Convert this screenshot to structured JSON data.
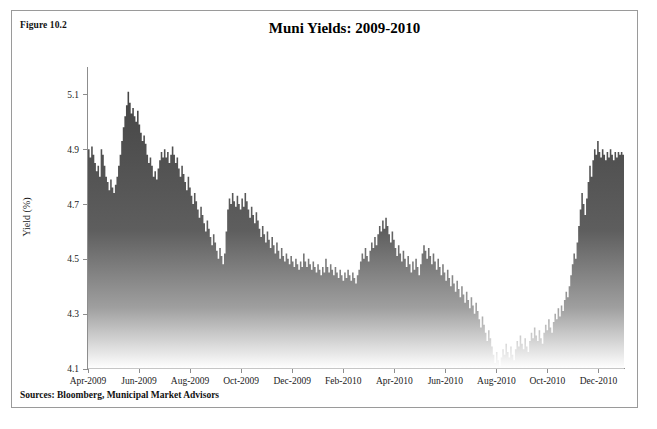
{
  "figure": {
    "label": "Figure 10.2",
    "title": "Muni Yields: 2009-2010",
    "sources": "Sources: Bloomberg, Municipal Market Advisors"
  },
  "colors": {
    "frame_border": "#9a9a9a",
    "area_top": "#4a4a4a",
    "area_bottom": "#ffffff",
    "axis": "#8d8d8d",
    "text": "#111111",
    "background": "#ffffff"
  },
  "chart_data": {
    "type": "area",
    "title": "Muni Yields: 2009-2010",
    "xlabel": "",
    "ylabel": "Yield (%)",
    "ylim": [
      4.1,
      5.2
    ],
    "yticks": [
      4.1,
      4.3,
      4.5,
      4.7,
      4.9,
      5.1
    ],
    "ytick_labels": [
      "4.1",
      "4.3",
      "4.5",
      "4.7",
      "4.9",
      "5.1"
    ],
    "grid": false,
    "legend": "none",
    "xtick_labels": [
      "Apr-2009",
      "Jun-2009",
      "Aug-2009",
      "Oct-2009",
      "Dec-2009",
      "Feb-2010",
      "Apr-2010",
      "Jun-2010",
      "Aug-2010",
      "Oct-2010",
      "Dec-2010"
    ],
    "xtick_positions": [
      0,
      0.0952,
      0.1905,
      0.2857,
      0.381,
      0.4762,
      0.5714,
      0.6667,
      0.7619,
      0.8571,
      0.9524
    ],
    "series": [
      {
        "name": "Muni Yield",
        "fill": "gradient-gray",
        "values": [
          4.93,
          4.9,
          4.87,
          4.91,
          4.88,
          4.85,
          4.82,
          4.84,
          4.8,
          4.9,
          4.88,
          4.84,
          4.8,
          4.78,
          4.75,
          4.79,
          4.76,
          4.74,
          4.77,
          4.8,
          4.84,
          4.88,
          4.93,
          4.98,
          5.02,
          5.06,
          5.11,
          5.07,
          5.03,
          5.05,
          5.02,
          5.0,
          5.04,
          4.99,
          4.96,
          4.93,
          4.95,
          4.92,
          4.88,
          4.85,
          4.87,
          4.84,
          4.8,
          4.82,
          4.79,
          4.83,
          4.86,
          4.89,
          4.87,
          4.9,
          4.87,
          4.89,
          4.85,
          4.88,
          4.91,
          4.88,
          4.85,
          4.87,
          4.83,
          4.8,
          4.84,
          4.81,
          4.78,
          4.75,
          4.8,
          4.76,
          4.73,
          4.7,
          4.74,
          4.71,
          4.68,
          4.65,
          4.69,
          4.66,
          4.63,
          4.6,
          4.64,
          4.61,
          4.58,
          4.55,
          4.59,
          4.56,
          4.53,
          4.5,
          4.54,
          4.51,
          4.48,
          4.52,
          4.6,
          4.68,
          4.72,
          4.7,
          4.74,
          4.71,
          4.69,
          4.73,
          4.7,
          4.68,
          4.72,
          4.69,
          4.74,
          4.71,
          4.68,
          4.65,
          4.69,
          4.66,
          4.63,
          4.67,
          4.64,
          4.61,
          4.58,
          4.62,
          4.59,
          4.56,
          4.6,
          4.57,
          4.54,
          4.58,
          4.55,
          4.52,
          4.56,
          4.53,
          4.5,
          4.54,
          4.51,
          4.49,
          4.52,
          4.5,
          4.48,
          4.51,
          4.49,
          4.47,
          4.5,
          4.48,
          4.46,
          4.49,
          4.47,
          4.52,
          4.49,
          4.47,
          4.5,
          4.48,
          4.46,
          4.49,
          4.47,
          4.45,
          4.48,
          4.46,
          4.44,
          4.47,
          4.45,
          4.5,
          4.47,
          4.45,
          4.48,
          4.46,
          4.44,
          4.47,
          4.45,
          4.43,
          4.46,
          4.44,
          4.42,
          4.45,
          4.43,
          4.46,
          4.44,
          4.42,
          4.45,
          4.43,
          4.41,
          4.44,
          4.46,
          4.49,
          4.52,
          4.5,
          4.54,
          4.51,
          4.49,
          4.53,
          4.56,
          4.54,
          4.58,
          4.55,
          4.59,
          4.62,
          4.6,
          4.64,
          4.61,
          4.65,
          4.62,
          4.59,
          4.56,
          4.6,
          4.57,
          4.54,
          4.51,
          4.55,
          4.52,
          4.49,
          4.53,
          4.5,
          4.47,
          4.51,
          4.48,
          4.45,
          4.49,
          4.46,
          4.5,
          4.47,
          4.44,
          4.48,
          4.52,
          4.55,
          4.53,
          4.5,
          4.54,
          4.51,
          4.48,
          4.52,
          4.49,
          4.46,
          4.5,
          4.47,
          4.44,
          4.48,
          4.45,
          4.42,
          4.46,
          4.43,
          4.4,
          4.44,
          4.41,
          4.38,
          4.42,
          4.39,
          4.36,
          4.4,
          4.37,
          4.34,
          4.38,
          4.35,
          4.32,
          4.36,
          4.33,
          4.3,
          4.34,
          4.31,
          4.28,
          4.25,
          4.29,
          4.26,
          4.23,
          4.2,
          4.24,
          4.21,
          4.18,
          4.15,
          4.12,
          4.16,
          4.13,
          4.11,
          4.14,
          4.17,
          4.15,
          4.19,
          4.16,
          4.14,
          4.18,
          4.15,
          4.13,
          4.17,
          4.2,
          4.18,
          4.22,
          4.19,
          4.17,
          4.21,
          4.18,
          4.16,
          4.2,
          4.23,
          4.21,
          4.25,
          4.22,
          4.2,
          4.24,
          4.21,
          4.19,
          4.23,
          4.26,
          4.24,
          4.28,
          4.25,
          4.23,
          4.27,
          4.3,
          4.28,
          4.32,
          4.29,
          4.33,
          4.31,
          4.35,
          4.38,
          4.36,
          4.4,
          4.44,
          4.48,
          4.52,
          4.5,
          4.56,
          4.62,
          4.68,
          4.74,
          4.7,
          4.66,
          4.72,
          4.78,
          4.84,
          4.8,
          4.86,
          4.9,
          4.88,
          4.93,
          4.89,
          4.87,
          4.9,
          4.88,
          4.86,
          4.89,
          4.87,
          4.9,
          4.88,
          4.86,
          4.89,
          4.87,
          4.89,
          4.88,
          4.89,
          4.88
        ]
      }
    ]
  }
}
